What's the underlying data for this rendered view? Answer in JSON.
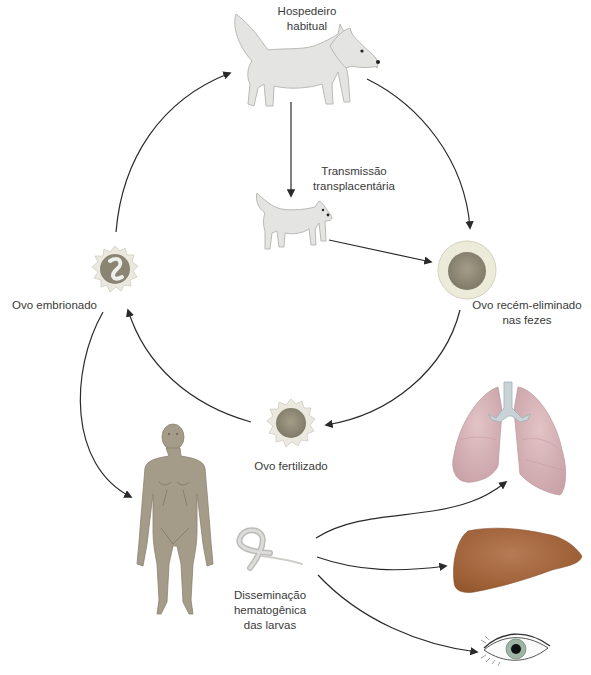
{
  "diagram": {
    "type": "life-cycle",
    "language": "pt",
    "colors": {
      "dog": "#e4e4e2",
      "dog_outline": "#b9b9b6",
      "egg_shell": "#eae8dc",
      "egg_core": "#8e8a78",
      "human": "#a59b89",
      "lungs": "#d7b4b9",
      "trachea": "#c9d3d6",
      "liver": "#a5663f",
      "iris": "#9db5a4",
      "arrow": "#2a2a2a",
      "text": "#3a3a3a"
    },
    "nodes": [
      {
        "id": "definitive-host",
        "label_lines": [
          "Hospedeiro",
          "habitual"
        ],
        "icon": "adult-dog"
      },
      {
        "id": "transplacental",
        "label_lines": [
          "Transmissão",
          "transplacentária"
        ],
        "icon": "puppy"
      },
      {
        "id": "fresh-egg",
        "label_lines": [
          "Ovo recém-eliminado",
          "nas fezes"
        ],
        "icon": "unembryonated-egg"
      },
      {
        "id": "fertilized-egg",
        "label_lines": [
          "Ovo fertilizado"
        ],
        "icon": "fertilized-egg"
      },
      {
        "id": "embryonated-egg",
        "label_lines": [
          "Ovo embrionado"
        ],
        "icon": "embryonated-egg"
      },
      {
        "id": "human",
        "label_lines": [],
        "icon": "human-figure"
      },
      {
        "id": "larvae",
        "label_lines": [
          "Disseminação",
          "hematogênica",
          "das larvas"
        ],
        "icon": "larva"
      },
      {
        "id": "lungs",
        "label_lines": [],
        "icon": "lungs"
      },
      {
        "id": "liver",
        "label_lines": [],
        "icon": "liver"
      },
      {
        "id": "eye",
        "label_lines": [],
        "icon": "eye"
      }
    ],
    "edges": [
      {
        "from": "definitive-host",
        "to": "fresh-egg"
      },
      {
        "from": "definitive-host",
        "to": "transplacental"
      },
      {
        "from": "transplacental",
        "to": "fresh-egg"
      },
      {
        "from": "fresh-egg",
        "to": "fertilized-egg"
      },
      {
        "from": "fertilized-egg",
        "to": "embryonated-egg"
      },
      {
        "from": "embryonated-egg",
        "to": "definitive-host"
      },
      {
        "from": "embryonated-egg",
        "to": "human"
      },
      {
        "from": "larvae",
        "to": "lungs"
      },
      {
        "from": "larvae",
        "to": "liver"
      },
      {
        "from": "larvae",
        "to": "eye"
      }
    ]
  },
  "labels": {
    "host_1": "Hospedeiro",
    "host_2": "habitual",
    "transplacental_1": "Transmissão",
    "transplacental_2": "transplacentária",
    "fresh_egg_1": "Ovo recém-eliminado",
    "fresh_egg_2": "nas fezes",
    "fertilized_egg": "Ovo fertilizado",
    "embryonated_egg": "Ovo embrionado",
    "larvae_1": "Disseminação",
    "larvae_2": "hematogênica",
    "larvae_3": "das larvas"
  }
}
